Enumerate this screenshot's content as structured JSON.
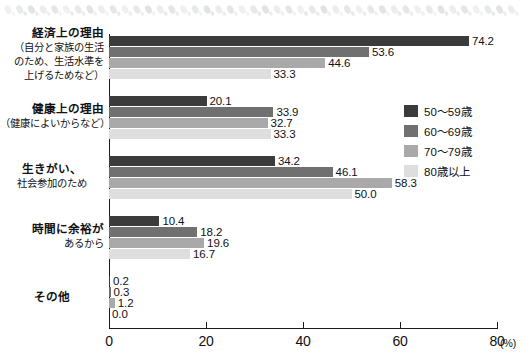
{
  "ornament": {
    "name": "leaf-dot-border",
    "dot_count": 44,
    "color": "#c9cdcb"
  },
  "chart_data": {
    "type": "bar",
    "orientation": "horizontal",
    "title": "",
    "xlabel": "(%)",
    "ylabel": "",
    "xlim": [
      0,
      80
    ],
    "xticks": [
      0,
      20,
      40,
      60,
      80
    ],
    "xtick_labels": [
      "0",
      "20",
      "40",
      "60",
      "80"
    ],
    "unit": "(%)",
    "grid": false,
    "legend_position": "right",
    "categories": [
      "経済上の理由（自分と家族の生活のため、生活水準を上げるためなど）",
      "健康上の理由（健康によいからなど）",
      "生きがい、社会参加のため",
      "時間に余裕があるから",
      "その他"
    ],
    "category_lines": [
      [
        "経済上の理由",
        "（自分と家族の生活",
        "のため、生活水準を",
        "上げるためなど）"
      ],
      [
        "健康上の理由",
        "（健康によいからなど）"
      ],
      [
        "生きがい、",
        "社会参加のため"
      ],
      [
        "時間に余裕が",
        "あるから"
      ],
      [
        "その他"
      ]
    ],
    "series": [
      {
        "name": "50～59歳",
        "color": "#3b3b3b",
        "values": [
          74.2,
          20.1,
          34.2,
          10.4,
          0.2
        ]
      },
      {
        "name": "60～69歳",
        "color": "#707070",
        "values": [
          53.6,
          33.9,
          46.1,
          18.2,
          0.3
        ]
      },
      {
        "name": "70～79歳",
        "color": "#a9a9a9",
        "values": [
          44.6,
          32.7,
          58.3,
          19.6,
          1.2
        ]
      },
      {
        "name": "80歳以上",
        "color": "#dedede",
        "values": [
          33.3,
          33.3,
          50.0,
          16.7,
          0.0
        ]
      }
    ],
    "value_labels": [
      [
        "74.2",
        "53.6",
        "44.6",
        "33.3"
      ],
      [
        "20.1",
        "33.9",
        "32.7",
        "33.3"
      ],
      [
        "34.2",
        "46.1",
        "58.3",
        "50.0"
      ],
      [
        "10.4",
        "18.2",
        "19.6",
        "16.7"
      ],
      [
        "0.2",
        "0.3",
        "1.2",
        "0.0"
      ]
    ]
  },
  "legend": {
    "items": [
      {
        "label": "50～59歳",
        "color": "#3b3b3b"
      },
      {
        "label": "60～69歳",
        "color": "#707070"
      },
      {
        "label": "70～79歳",
        "color": "#a9a9a9"
      },
      {
        "label": "80歳以上",
        "color": "#dedede"
      }
    ]
  }
}
